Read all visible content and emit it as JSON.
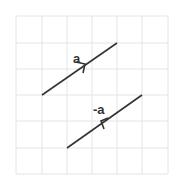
{
  "diagram": {
    "grid": {
      "cols": 6,
      "rows": 6,
      "color": "#e4e4e4"
    },
    "vectors": [
      {
        "label": "a",
        "direction": "up-right"
      },
      {
        "label": "-a",
        "direction": "down-left"
      }
    ],
    "line_color": "#333333"
  }
}
